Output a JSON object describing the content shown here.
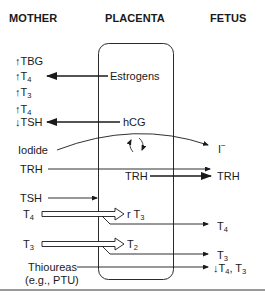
{
  "headers": {
    "mother": "MOTHER",
    "placenta": "PLACENTA",
    "fetus": "FETUS"
  },
  "mother": {
    "tbg": {
      "arrow": "↑",
      "text": "TBG"
    },
    "t4_up": {
      "arrow": "↑",
      "text": "T",
      "sub": "4"
    },
    "t3_up": {
      "arrow": "↑",
      "text": "T",
      "sub": "3"
    },
    "t4_up2": {
      "arrow": "↑",
      "text": "T",
      "sub": "4"
    },
    "tsh_down": {
      "arrow": "↓",
      "text": "TSH"
    },
    "iodide": "Iodide",
    "trh": "TRH",
    "tsh": "TSH",
    "t4": {
      "text": "T",
      "sub": "4"
    },
    "t3": {
      "text": "T",
      "sub": "3"
    },
    "thioureas_line1": "Thioureas",
    "thioureas_line2": "(e.g., PTU)"
  },
  "placenta": {
    "estrogens": "Estrogens",
    "hcg": "hCG",
    "trh": "TRH",
    "rt3": {
      "text": "r T",
      "sub": "3"
    },
    "t2": {
      "text": "T",
      "sub": "2"
    }
  },
  "fetus": {
    "iodide_ion": {
      "text": "I",
      "sup": "−"
    },
    "trh": "TRH",
    "t4": {
      "text": "T",
      "sub": "4"
    },
    "t3": {
      "text": "T",
      "sub": "3"
    },
    "t4_t3_down": {
      "arrow": "↓",
      "text": "T",
      "sub1": "4",
      "mid": ", T",
      "sub2": "3"
    }
  }
}
